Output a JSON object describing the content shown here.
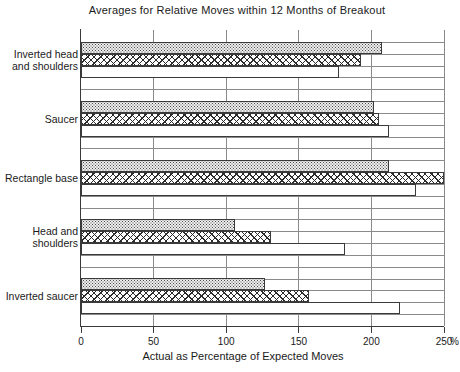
{
  "chart_data": {
    "type": "bar",
    "orientation": "horizontal",
    "title": "Averages for Relative Moves within 12 Months of Breakout",
    "xlabel": "Actual as Percentage of Expected Moves",
    "ylabel": "",
    "xlim": [
      0,
      250
    ],
    "xticks": [
      0,
      50,
      100,
      150,
      200,
      250
    ],
    "xtick_labels": [
      "0",
      "50",
      "100",
      "150",
      "200",
      "250"
    ],
    "x_unit_suffix": "%",
    "grid": true,
    "legend": "none",
    "categories": [
      "Inverted head\nand shoulders",
      "Saucer",
      "Rectangle base",
      "Head and\nshoulders",
      "Inverted saucer"
    ],
    "category_lines": [
      [
        "Inverted head",
        "and  shoulders"
      ],
      [
        "Saucer"
      ],
      [
        "Rectangle base"
      ],
      [
        "Head  and",
        "shoulders"
      ],
      [
        "Inverted saucer"
      ]
    ],
    "series": [
      {
        "name": "dotted",
        "pattern": "dotted",
        "values": [
          207,
          202,
          212,
          106,
          127
        ]
      },
      {
        "name": "crosshatch",
        "pattern": "crosshatch",
        "values": [
          193,
          205,
          250,
          131,
          157
        ]
      },
      {
        "name": "plain",
        "pattern": "plain",
        "values": [
          178,
          212,
          231,
          182,
          220
        ]
      }
    ]
  },
  "axis": {
    "tick_0": "0",
    "tick_50": "50",
    "tick_100": "100",
    "tick_150": "150",
    "tick_200": "200",
    "tick_250": "250",
    "percent": "%"
  },
  "labels": {
    "title": "Averages for Relative Moves within 12 Months of Breakout",
    "xaxis": "Actual as Percentage of Expected Moves",
    "cat_0_line_0": "Inverted head",
    "cat_0_line_1": "and  shoulders",
    "cat_1_line_0": "Saucer",
    "cat_2_line_0": "Rectangle base",
    "cat_3_line_0": "Head  and",
    "cat_3_line_1": "shoulders",
    "cat_4_line_0": "Inverted saucer"
  },
  "colors": {
    "axis": "#3a3a3a",
    "grid": "#8a8a8a",
    "dotted_fill": "#eeeeee",
    "plain_fill": "#ffffff",
    "text": "#1a1a1a"
  }
}
